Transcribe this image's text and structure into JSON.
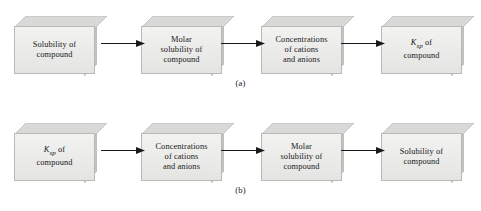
{
  "figure": {
    "colors": {
      "front_face": "#ececeb",
      "top_face": "#d9d9d7",
      "side_face": "#c3c3c0",
      "outline": "#b9b9b6",
      "arrow": "#1a1a1a",
      "text": "#1a1a1a",
      "background": "#ffffff"
    },
    "rows": [
      {
        "id": "row-a",
        "caption": "(a)",
        "boxes": [
          {
            "id": "solubility",
            "line1": "Solubility of",
            "line2": "compound",
            "text": "Solubility of\ncompound",
            "has_ksp": false
          },
          {
            "id": "molar-solubility",
            "line1": "Molar",
            "line2": "solubility of",
            "line3": "compound",
            "text": "Molar\nsolubility of\ncompound",
            "has_ksp": false
          },
          {
            "id": "concentrations",
            "line1": "Concentrations",
            "line2": "of cations",
            "line3": "and anions",
            "text": "Concentrations\nof cations\nand anions",
            "has_ksp": false
          },
          {
            "id": "ksp",
            "symbol": "K",
            "subscript": "sp",
            "line1": " of",
            "line2": "compound",
            "text": "Ksp of compound",
            "has_ksp": true
          }
        ],
        "arrows": [
          "arrow-a-1",
          "arrow-a-2",
          "arrow-a-3"
        ]
      },
      {
        "id": "row-b",
        "caption": "(b)",
        "boxes": [
          {
            "id": "ksp",
            "symbol": "K",
            "subscript": "sp",
            "line1": " of",
            "line2": "compound",
            "text": "Ksp of compound",
            "has_ksp": true
          },
          {
            "id": "concentrations",
            "line1": "Concentrations",
            "line2": "of cations",
            "line3": "and anions",
            "text": "Concentrations\nof cations\nand anions",
            "has_ksp": false
          },
          {
            "id": "molar-solubility",
            "line1": "Molar",
            "line2": "solubility of",
            "line3": "compound",
            "text": "Molar\nsolubility of\ncompound",
            "has_ksp": false
          },
          {
            "id": "solubility",
            "line1": "Solubility of",
            "line2": "compound",
            "text": "Solubility of\ncompound",
            "has_ksp": false
          }
        ],
        "arrows": [
          "arrow-b-1",
          "arrow-b-2",
          "arrow-b-3"
        ]
      }
    ]
  }
}
